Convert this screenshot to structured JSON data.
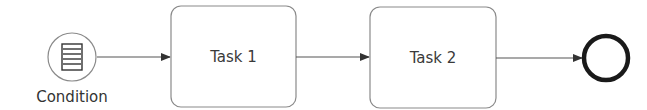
{
  "diagram": {
    "type": "BPMN process",
    "colors": {
      "stroke": "#6e6e6e",
      "end_event_stroke": "#1a1a1a",
      "text": "#3a3a3a",
      "background": "#ffffff"
    },
    "start_event": {
      "kind": "conditional-start-event",
      "icon": "condition-document-icon",
      "label": "Condition"
    },
    "tasks": [
      {
        "label": "Task 1"
      },
      {
        "label": "Task 2"
      }
    ],
    "end_event": {
      "kind": "end-event"
    },
    "flows": [
      {
        "from": "Condition",
        "to": "Task 1"
      },
      {
        "from": "Task 1",
        "to": "Task 2"
      },
      {
        "from": "Task 2",
        "to": "end"
      }
    ]
  }
}
